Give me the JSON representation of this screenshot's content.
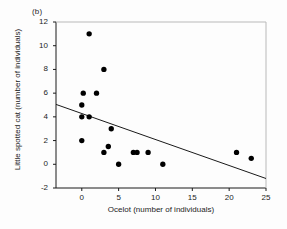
{
  "panel": {
    "label": "(b)"
  },
  "chart_data": {
    "type": "scatter",
    "title": "",
    "panel_label": "(b)",
    "xlabel": "Ocelot (number of individuals)",
    "ylabel": "Little spotted cat (number of individuals)",
    "xlim": [
      -3.5,
      25
    ],
    "ylim": [
      -2,
      12
    ],
    "xticks": [
      0,
      5,
      10,
      15,
      20,
      25
    ],
    "yticks": [
      -2,
      0,
      2,
      4,
      6,
      8,
      10,
      12
    ],
    "xtick_labels": [
      "0",
      "5",
      "10",
      "15",
      "20",
      "25"
    ],
    "ytick_labels": [
      "-2",
      "0",
      "2",
      "4",
      "6",
      "8",
      "10",
      "12"
    ],
    "grid": false,
    "legend": null,
    "marker": {
      "shape": "circle",
      "color": "#000000",
      "size": 4
    },
    "points": [
      {
        "x": 1,
        "y": 11
      },
      {
        "x": 3,
        "y": 8
      },
      {
        "x": 0.2,
        "y": 6
      },
      {
        "x": 2,
        "y": 6
      },
      {
        "x": 0,
        "y": 5
      },
      {
        "x": 0,
        "y": 4
      },
      {
        "x": 1,
        "y": 4
      },
      {
        "x": 4,
        "y": 3
      },
      {
        "x": 0,
        "y": 2
      },
      {
        "x": 3.6,
        "y": 1.5
      },
      {
        "x": 3,
        "y": 1
      },
      {
        "x": 7,
        "y": 1
      },
      {
        "x": 7.5,
        "y": 1
      },
      {
        "x": 9,
        "y": 1
      },
      {
        "x": 21,
        "y": 1
      },
      {
        "x": 23,
        "y": 0.5
      },
      {
        "x": 5,
        "y": 0
      },
      {
        "x": 11,
        "y": 0
      }
    ],
    "trendline": {
      "type": "linear-fit",
      "x_start": -3.5,
      "y_start": 5.05,
      "x_end": 25,
      "y_end": -1.2,
      "color": "#1a1a1a"
    }
  },
  "axes": {
    "line_color": "#1a1a1a",
    "tick_color": "#1a1a1a"
  }
}
